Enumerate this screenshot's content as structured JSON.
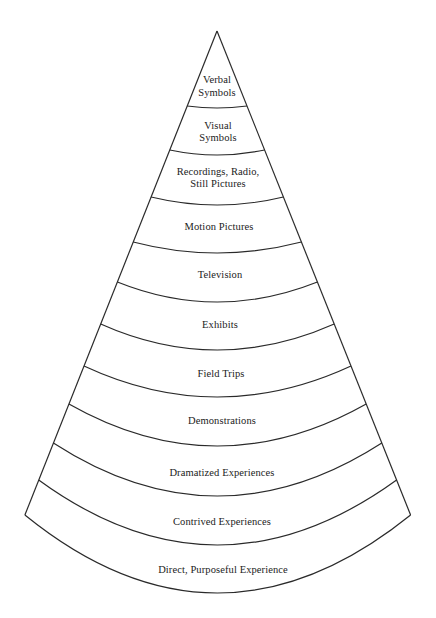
{
  "diagram": {
    "type": "cone",
    "orientation": "apex-up",
    "colors": {
      "stroke": "#2a2a2a",
      "text": "#222222",
      "background": "#ffffff"
    },
    "bands_top_to_bottom": [
      {
        "id": "verbal-symbols",
        "lines": [
          "Verbal",
          "Symbols"
        ]
      },
      {
        "id": "visual-symbols",
        "lines": [
          "Visual",
          "Symbols"
        ]
      },
      {
        "id": "recordings-radio-still-pictures",
        "lines": [
          "Recordings, Radio,",
          "Still Pictures"
        ]
      },
      {
        "id": "motion-pictures",
        "lines": [
          "Motion Pictures"
        ]
      },
      {
        "id": "television",
        "lines": [
          "Television"
        ]
      },
      {
        "id": "exhibits",
        "lines": [
          "Exhibits"
        ]
      },
      {
        "id": "field-trips",
        "lines": [
          "Field Trips"
        ]
      },
      {
        "id": "demonstrations",
        "lines": [
          "Demonstrations"
        ]
      },
      {
        "id": "dramatized-experiences",
        "lines": [
          "Dramatized Experiences"
        ]
      },
      {
        "id": "contrived-experiences",
        "lines": [
          "Contrived Experiences"
        ]
      },
      {
        "id": "direct-purposeful-experience",
        "lines": [
          "Direct, Purposeful Experience"
        ]
      }
    ]
  }
}
